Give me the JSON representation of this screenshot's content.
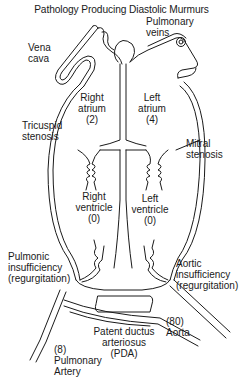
{
  "title": "Pathology Producing Diastolic Murmurs",
  "labels": {
    "vena_cava": "Vena\ncava",
    "pulmonary_veins": "Pulmonary\nveins",
    "right_atrium": "Right\natrium\n(2)",
    "left_atrium": "Left\natrium\n(4)",
    "tricuspid_stenosis": "Tricuspid\nstenosis",
    "mitral_stenosis": "Mitral\nstenosis",
    "right_ventricle": "Right\nventricle\n(0)",
    "left_ventricle": "Left\nventricle\n(0)",
    "pulmonic_insufficiency": "Pulmonic\ninsufficiency\n(regurgitation)",
    "aortic_insufficiency": "Aortic\ninsufficiency\n(regurgitation)",
    "aorta": "(80)\nAorta",
    "pda": "Patent ductus\narteriosus\n(PDA)",
    "pulmonary_artery": "(8)\nPulmonary\nArtery"
  },
  "pressures": {
    "right_atrium": 2,
    "left_atrium": 4,
    "right_ventricle": 0,
    "left_ventricle": 0,
    "aorta": 80,
    "pulmonary_artery": 8
  },
  "colors": {
    "line": "#1a1a1a",
    "background": "#ffffff"
  }
}
